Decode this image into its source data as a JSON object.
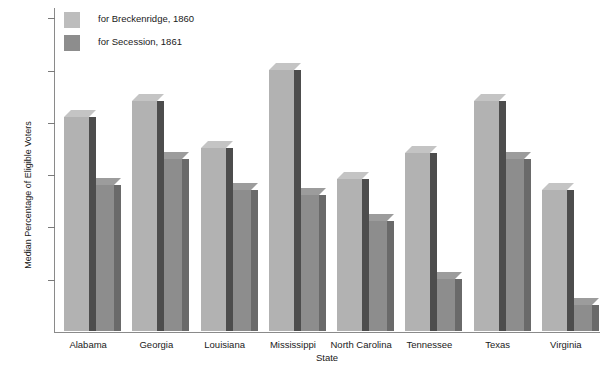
{
  "chart_data": {
    "type": "bar",
    "title": "Median Percentage of Eligible Voters for Breckenridge, 1860, and for Secession, 1861",
    "xlabel": "State",
    "ylabel": "Median Percentage of Eligible Voters",
    "ylim": [
      0,
      62
    ],
    "yticks": [
      10,
      20,
      30,
      40,
      50,
      60
    ],
    "grid": false,
    "legend_position": "top-left",
    "categories": [
      "Alabama",
      "Georgia",
      "Louisiana",
      "Mississippi",
      "North Carolina",
      "Tennessee",
      "Texas",
      "Virginia"
    ],
    "series": [
      {
        "name": "for Breckenridge, 1860",
        "color": "#b2b2b2",
        "values": [
          41,
          44,
          35,
          50,
          29,
          34,
          44,
          27
        ]
      },
      {
        "name": "for Secession, 1861",
        "color": "#8d8d8d",
        "values": [
          28,
          33,
          27,
          26,
          21,
          10,
          33,
          5
        ]
      }
    ]
  },
  "legend": {
    "items": [
      {
        "label": "for Breckenridge, 1860",
        "swatch": "light"
      },
      {
        "label": "for Secession, 1861",
        "swatch": "darker"
      }
    ]
  },
  "colors": {
    "series_light": "#b2b2b2",
    "series_dark": "#8d8d8d",
    "bar_side_light": "#4d4d4d",
    "bar_side_dark": "#6a6a6a",
    "axis": "#8a8a8a",
    "text": "#1a1a1a",
    "background": "#ffffff"
  }
}
